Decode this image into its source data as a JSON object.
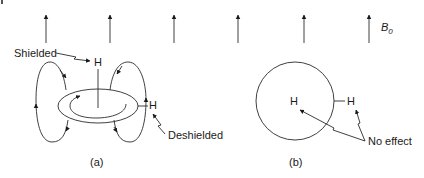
{
  "field": {
    "label": "B",
    "subscript": "0",
    "arrow_count": 6,
    "arrow_x": [
      46,
      110,
      174,
      238,
      304,
      369
    ]
  },
  "panel_a": {
    "caption": "(a)",
    "labels": {
      "shielded": "Shielded",
      "deshielded": "Deshielded",
      "h_top": "H",
      "h_side": "H"
    }
  },
  "panel_b": {
    "caption": "(b)",
    "labels": {
      "h_inside": "H",
      "h_outside": "H",
      "no_effect": "No effect"
    }
  },
  "colors": {
    "stroke": "#2a2a2a",
    "text": "#1a1a1a",
    "background": "#ffffff"
  }
}
